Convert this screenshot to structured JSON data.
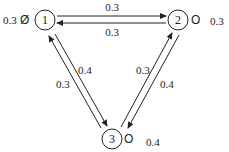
{
  "diagram": {
    "type": "markov-chain",
    "nodes": [
      {
        "id": "1",
        "label": "1",
        "self_value": "0.3",
        "marker": "Ø"
      },
      {
        "id": "2",
        "label": "2",
        "self_value": "0.3",
        "marker": "O"
      },
      {
        "id": "3",
        "label": "3",
        "self_value": "0.4",
        "marker": "O"
      }
    ],
    "edges": [
      {
        "from": "1",
        "to": "2",
        "label": "0.3"
      },
      {
        "from": "2",
        "to": "1",
        "label": "0.3"
      },
      {
        "from": "1",
        "to": "3",
        "label": "0.4"
      },
      {
        "from": "3",
        "to": "1",
        "label": "0.3"
      },
      {
        "from": "3",
        "to": "2",
        "label": "0.3"
      },
      {
        "from": "2",
        "to": "3",
        "label": "0.4"
      }
    ]
  }
}
